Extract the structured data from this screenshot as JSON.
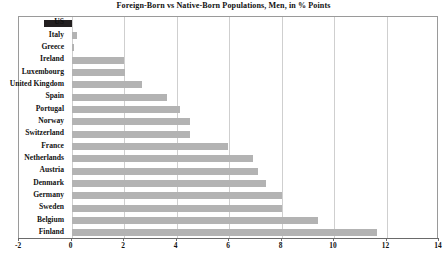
{
  "chart_data": {
    "type": "bar",
    "orientation": "horizontal",
    "title": "Foreign-Born vs Native-Born Populations, Men, in % Points",
    "xlabel": "",
    "ylabel": "",
    "xlim": [
      -2,
      14
    ],
    "xticks": [
      -2,
      0,
      2,
      4,
      6,
      8,
      10,
      12,
      14
    ],
    "xtick_labels": [
      "-2",
      "0",
      "2",
      "4",
      "6",
      "8",
      "10",
      "12",
      "14"
    ],
    "grid": true,
    "legend": null,
    "categories": [
      "US",
      "Italy",
      "Greece",
      "Ireland",
      "Luxembourg",
      "United Kingdom",
      "Spain",
      "Portugal",
      "Norway",
      "Switzerland",
      "France",
      "Netherlands",
      "Austria",
      "Denmark",
      "Germany",
      "Sweden",
      "Belgium",
      "Finland"
    ],
    "values": [
      -1.05,
      0.2,
      0.1,
      2.0,
      2.05,
      2.7,
      3.65,
      4.15,
      4.5,
      4.5,
      5.95,
      6.9,
      7.1,
      7.4,
      8.0,
      8.0,
      9.4,
      11.65
    ],
    "bar_colors": [
      "#231f20",
      "#b3b3b3",
      "#b3b3b3",
      "#b3b3b3",
      "#b3b3b3",
      "#b3b3b3",
      "#b3b3b3",
      "#b3b3b3",
      "#b3b3b3",
      "#b3b3b3",
      "#b3b3b3",
      "#b3b3b3",
      "#b3b3b3",
      "#b3b3b3",
      "#b3b3b3",
      "#b3b3b3",
      "#b3b3b3",
      "#b3b3b3"
    ],
    "highlight_category": "US",
    "highlight_color": "#231f20",
    "series_color": "#b3b3b3"
  }
}
